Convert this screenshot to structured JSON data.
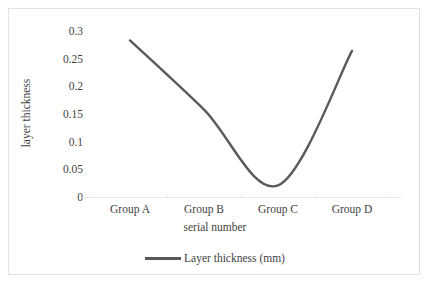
{
  "chart_data": {
    "type": "line",
    "title": "",
    "categories": [
      "Group A",
      "Group B",
      "Group C",
      "Group D"
    ],
    "series": [
      {
        "name": "Layer thickness (mm)",
        "values": [
          0.283,
          0.158,
          0.021,
          0.264
        ],
        "color": "#5a5a5a"
      }
    ],
    "xlabel": "serial number",
    "ylabel": "layer thickness",
    "ylim": [
      0,
      0.3
    ],
    "ytick_labels": [
      "0.3",
      "0.25",
      "0.2",
      "0.15",
      "0.1",
      "0.05",
      "0"
    ],
    "ytick_values": [
      0.3,
      0.25,
      0.2,
      0.15,
      0.1,
      0.05,
      0
    ],
    "grid": false,
    "smooth": true,
    "legend_position": "bottom",
    "legend_entries": [
      "Layer thickness (mm)"
    ]
  },
  "axis": {
    "y_title": "layer thickness",
    "x_title": "serial number"
  },
  "legend": {
    "label": "Layer thickness (mm)",
    "marker": "line-marker"
  },
  "colors": {
    "series": "#5a5a5a",
    "axis": "#e6e6e6",
    "border": "#e2e2e2",
    "text": "#3f3f3f"
  }
}
